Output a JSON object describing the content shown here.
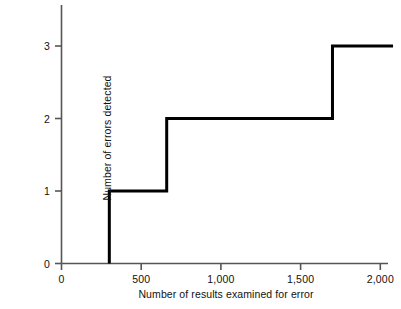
{
  "chart_data": {
    "type": "line",
    "step": "post",
    "title": "",
    "subtitle": "",
    "xlabel": "Number of results examined for error",
    "ylabel": "Number of errors detected",
    "xlim": [
      0,
      2080
    ],
    "ylim": [
      0,
      3.35
    ],
    "xticks": [
      0,
      500,
      1000,
      1500,
      2000
    ],
    "xtick_labels": [
      "0",
      "500",
      "1,000",
      "1,500",
      "2,000"
    ],
    "yticks": [
      0,
      1,
      2,
      3
    ],
    "ytick_labels": [
      "0",
      "1",
      "2",
      "3"
    ],
    "grid": false,
    "legend": false,
    "legend_position": "none",
    "line_color": "#000000",
    "axis_color": "#4a4a4a",
    "background_color": "#ffffff",
    "line_width": 3,
    "series": [
      {
        "name": "Cumulative errors detected",
        "x": [
          300,
          300,
          660,
          660,
          1700,
          1700,
          2080
        ],
        "values": [
          0,
          1,
          1,
          2,
          2,
          3,
          3
        ]
      }
    ],
    "step_points": [
      {
        "x": 300,
        "y": 1
      },
      {
        "x": 660,
        "y": 2
      },
      {
        "x": 1700,
        "y": 3
      }
    ],
    "annotations": []
  },
  "axes": {
    "x_title": "Number of results examined for error",
    "y_title": "Number of errors detected",
    "x_tick_labels": [
      "0",
      "500",
      "1,000",
      "1,500",
      "2,000"
    ],
    "y_tick_labels": [
      "0",
      "1",
      "2",
      "3"
    ]
  }
}
